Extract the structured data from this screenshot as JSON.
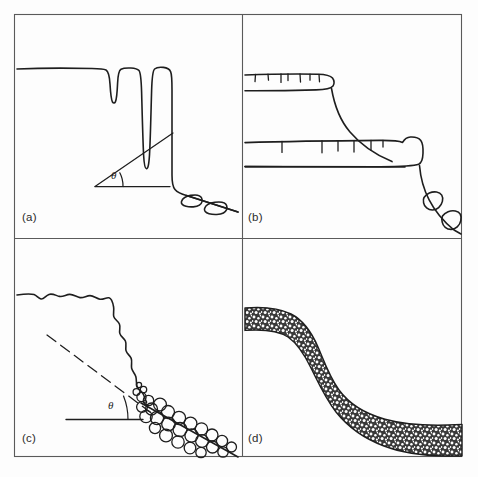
{
  "figure": {
    "kind": "line-diagram",
    "background_color": "#fdfdfd",
    "ink_color": "#1e1e1e",
    "frame": {
      "x": 14,
      "y": 14,
      "width": 448,
      "height": 443,
      "stroke_width": 1
    },
    "grid": {
      "rows": 2,
      "cols": 2,
      "divider_x": 242,
      "divider_y": 238
    }
  },
  "panels": [
    {
      "id": "a",
      "label": "(a)",
      "label_x": 22,
      "label_y": 211,
      "title": "jointed cliff with open fissures and rockfall boulders",
      "has_angle": true,
      "angle_symbol": "θ",
      "angle_x": 111,
      "angle_y": 169,
      "features": [
        "plateau-surface",
        "open-fissures",
        "vertical-cliff-face",
        "debris-slope",
        "boulders"
      ]
    },
    {
      "id": "b",
      "label": "(b)",
      "label_x": 248,
      "label_y": 211,
      "title": "stepped cliff with resistant ledges and concave debris slope",
      "has_angle": false,
      "angle_symbol": "",
      "features": [
        "upper-ledge",
        "lower-ledge",
        "joint-ticks",
        "concave-slope",
        "boulders"
      ]
    },
    {
      "id": "c",
      "label": "(c)",
      "label_x": 22,
      "label_y": 432,
      "title": "weathered cliff with talus / scree accumulation at its base",
      "has_angle": true,
      "angle_symbol": "θ",
      "angle_x": 108,
      "angle_y": 399,
      "features": [
        "irregular-cliff-profile",
        "dashed-reference-line",
        "scree-cones",
        "talus-blocks"
      ]
    },
    {
      "id": "d",
      "label": "(d)",
      "label_x": 248,
      "label_y": 432,
      "title": "soil-mantled convexo-concave slope with regolith cover",
      "has_angle": false,
      "angle_symbol": "",
      "features": [
        "convex-crest",
        "straight-midslope",
        "concave-footslope",
        "stippled-regolith-mantle"
      ]
    }
  ],
  "annotations": {
    "theta_label": "θ",
    "theta_count": 2,
    "dashed_line_panel": "c",
    "solid_angle_line_panel": "a"
  }
}
